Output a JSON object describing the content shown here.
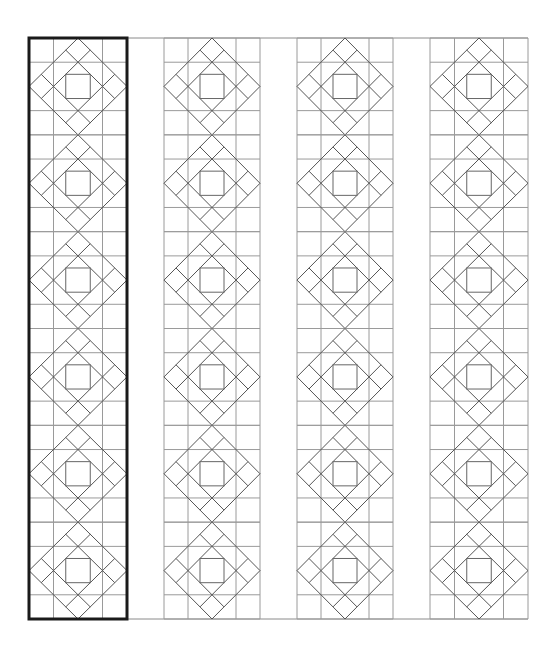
{
  "diagram": {
    "title": "",
    "type": "quilt-pattern-layout",
    "canvas": {
      "width": 558,
      "height": 656,
      "background": "#ffffff"
    },
    "frame": {
      "x1": 29,
      "x2": 528,
      "y_top": 38,
      "y_bottom": 619
    },
    "strips": [
      {
        "id": "strip-1",
        "x": 29,
        "width": 98,
        "highlighted": true
      },
      {
        "id": "strip-2",
        "x": 164,
        "width": 96,
        "highlighted": false
      },
      {
        "id": "strip-3",
        "x": 297,
        "width": 96,
        "highlighted": false
      },
      {
        "id": "strip-4",
        "x": 430,
        "width": 98,
        "highlighted": false
      }
    ],
    "blocks_per_strip": 6,
    "block_grid_units": 4,
    "colors": {
      "grid": "#9a9a9a",
      "diagonal": "#555555",
      "highlight_border": "#1a1a1a"
    }
  }
}
